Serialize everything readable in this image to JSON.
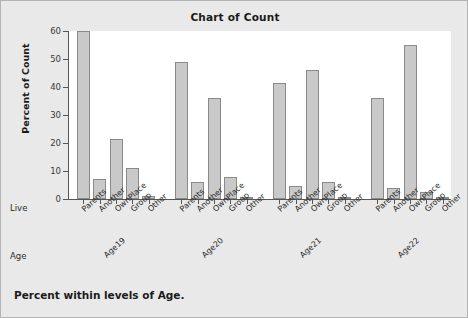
{
  "chart_data": {
    "type": "bar",
    "title": "Chart of Count",
    "xlabel": "Live",
    "ylabel": "Percent of Count",
    "footnote": "Percent within levels of Age.",
    "ylim": [
      0,
      60
    ],
    "yticks": [
      0,
      10,
      20,
      30,
      40,
      50,
      60
    ],
    "grid": false,
    "legend": "none",
    "categories": [
      "Parents",
      "Another",
      "OwnPlace",
      "Group",
      "Other"
    ],
    "group_axis_label": "Age",
    "groups": [
      "Age19",
      "Age20",
      "Age21",
      "Age22"
    ],
    "series": [
      {
        "name": "Age19",
        "values": [
          60.0,
          7.0,
          21.5,
          11.0,
          1.0
        ]
      },
      {
        "name": "Age20",
        "values": [
          49.0,
          6.0,
          36.0,
          7.7,
          0.3
        ]
      },
      {
        "name": "Age21",
        "values": [
          41.5,
          4.7,
          46.0,
          5.9,
          0.3
        ]
      },
      {
        "name": "Age22",
        "values": [
          36.0,
          4.0,
          55.0,
          2.5,
          0.8
        ]
      }
    ],
    "colors": {
      "bar_fill": "#c9c9c9",
      "bar_edge": "#8a8a8a",
      "plot_background": "#ffffff",
      "figure_background": "#e9e9e9",
      "axis": "#565656",
      "text": "#1a1a1a"
    }
  }
}
